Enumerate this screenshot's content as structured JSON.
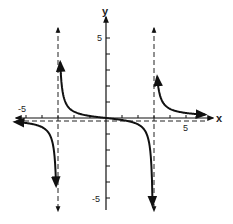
{
  "chart_data": {
    "type": "line",
    "title": "",
    "function": "y = x / (x^2 - 9)",
    "xlabel": "x",
    "ylabel": "y",
    "xlim": [
      -5.7,
      6.5
    ],
    "ylim": [
      -6,
      6
    ],
    "x_tick_labels": [
      {
        "value": -5,
        "label": "-5"
      },
      {
        "value": 5,
        "label": "5"
      }
    ],
    "y_tick_labels": [
      {
        "value": 5,
        "label": "5"
      },
      {
        "value": -5,
        "label": "-5"
      }
    ],
    "x_ticks": [
      -5,
      -4,
      -3,
      -2,
      -1,
      1,
      2,
      3,
      4,
      5
    ],
    "y_ticks": [
      -5,
      -4,
      -3,
      -2,
      -1,
      1,
      2,
      3,
      4,
      5
    ],
    "grid": false,
    "legend": null,
    "asymptotes": {
      "vertical": [
        -3,
        3
      ],
      "horizontal": [
        0
      ]
    },
    "series": [
      {
        "name": "left branch (x < -3)",
        "x": [
          -5.6,
          -5,
          -4.5,
          -4,
          -3.6,
          -3.3,
          -3.15
        ],
        "y": [
          -0.25,
          -0.31,
          -0.4,
          -0.57,
          -0.91,
          -1.65,
          -4.9
        ]
      },
      {
        "name": "middle branch (-3 < x < 3)",
        "x": [
          -2.85,
          -2.7,
          -2.5,
          -2,
          -1,
          0,
          1,
          2,
          2.5,
          2.7,
          2.92
        ],
        "y": [
          5.0,
          3.9,
          2.3,
          0.8,
          0.125,
          0,
          -0.125,
          -0.8,
          -2.3,
          -3.9,
          -5.0
        ]
      },
      {
        "name": "right branch (x > 3)",
        "x": [
          3.2,
          3.3,
          3.6,
          4,
          4.5,
          5,
          5.6,
          6.2
        ],
        "y": [
          4.3,
          1.65,
          0.91,
          0.57,
          0.4,
          0.31,
          0.25,
          0.21
        ]
      }
    ]
  },
  "labels": {
    "x_axis": "x",
    "y_axis": "y",
    "x_neg5": "-5",
    "x_pos5": "5",
    "y_pos5": "5",
    "y_neg5": "-5"
  }
}
